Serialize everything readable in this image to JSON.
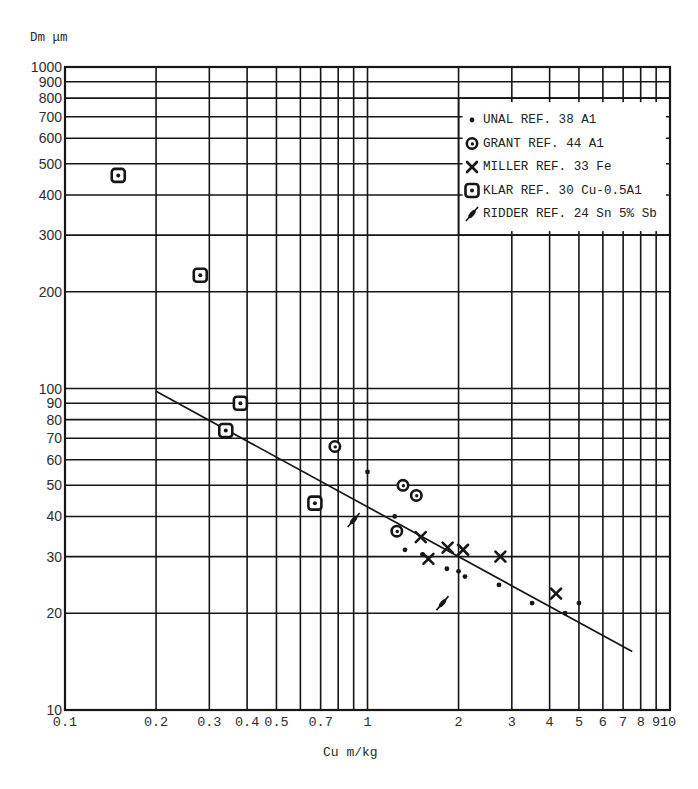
{
  "chart_data": {
    "type": "scatter",
    "title": "",
    "xlabel": "Cu m/kg",
    "ylabel": "Dm μm",
    "xscale": "log",
    "yscale": "log",
    "xlim": [
      0.1,
      10
    ],
    "ylim": [
      10,
      1000
    ],
    "grid": true,
    "x_ticks": [
      {
        "v": 0.1,
        "label": "0.1"
      },
      {
        "v": 0.2,
        "label": "0.2"
      },
      {
        "v": 0.3,
        "label": "0.3"
      },
      {
        "v": 0.4,
        "label": "0.4"
      },
      {
        "v": 0.5,
        "label": "0.5"
      },
      {
        "v": 0.7,
        "label": "0.7"
      },
      {
        "v": 1,
        "label": "1"
      },
      {
        "v": 2,
        "label": "2"
      },
      {
        "v": 3,
        "label": "3"
      },
      {
        "v": 4,
        "label": "4"
      },
      {
        "v": 5,
        "label": "5"
      },
      {
        "v": 6,
        "label": "6"
      },
      {
        "v": 7,
        "label": "7"
      },
      {
        "v": 8,
        "label": "8"
      },
      {
        "v": 9,
        "label": "9"
      },
      {
        "v": 10,
        "label": "10"
      }
    ],
    "y_ticks": [
      {
        "v": 10,
        "label": "10"
      },
      {
        "v": 20,
        "label": "20"
      },
      {
        "v": 30,
        "label": "30"
      },
      {
        "v": 40,
        "label": "40"
      },
      {
        "v": 50,
        "label": "50"
      },
      {
        "v": 60,
        "label": "60"
      },
      {
        "v": 70,
        "label": "70"
      },
      {
        "v": 80,
        "label": "80"
      },
      {
        "v": 90,
        "label": "90"
      },
      {
        "v": 100,
        "label": "100"
      },
      {
        "v": 200,
        "label": "200"
      },
      {
        "v": 300,
        "label": "300"
      },
      {
        "v": 400,
        "label": "400"
      },
      {
        "v": 500,
        "label": "500"
      },
      {
        "v": 600,
        "label": "600"
      },
      {
        "v": 700,
        "label": "700"
      },
      {
        "v": 800,
        "label": "800"
      },
      {
        "v": 900,
        "label": "900"
      },
      {
        "v": 1000,
        "label": "1000"
      }
    ],
    "x_gridlines": [
      0.2,
      0.3,
      0.4,
      0.5,
      0.6,
      0.7,
      0.8,
      0.9,
      1,
      2,
      3,
      4,
      5,
      6,
      7,
      8,
      9
    ],
    "y_gridlines": [
      20,
      30,
      40,
      50,
      60,
      70,
      80,
      90,
      100,
      200,
      300,
      400,
      500,
      600,
      700,
      800,
      900
    ],
    "legend_position": "upper right",
    "legend_box": {
      "x": [
        2,
        10
      ],
      "y": [
        300,
        800
      ]
    },
    "legend": [
      {
        "label": "UNAL REF. 38 A1",
        "marker": "dot"
      },
      {
        "label": "GRANT REF. 44 A1",
        "marker": "circle-dot"
      },
      {
        "label": "MILLER REF. 33 Fe",
        "marker": "cross"
      },
      {
        "label": "KLAR REF. 30 Cu-0.5A1",
        "marker": "square-dot"
      },
      {
        "label": "RIDDER REF. 24 Sn 5% Sb",
        "marker": "slash"
      }
    ],
    "series": [
      {
        "name": "UNAL REF. 38 A1",
        "key": "unal",
        "marker": "dot",
        "points": [
          [
            1.0,
            55
          ],
          [
            1.23,
            40
          ],
          [
            1.33,
            31.5
          ],
          [
            1.52,
            30.5
          ],
          [
            1.83,
            27.5
          ],
          [
            2.0,
            27
          ],
          [
            2.1,
            26
          ],
          [
            2.72,
            24.5
          ],
          [
            3.5,
            21.5
          ],
          [
            4.5,
            20
          ],
          [
            5.0,
            21.5
          ]
        ]
      },
      {
        "name": "GRANT REF. 44 A1",
        "key": "grant",
        "marker": "circle-dot",
        "points": [
          [
            0.78,
            66
          ],
          [
            1.31,
            50
          ],
          [
            1.45,
            46.5
          ],
          [
            1.25,
            36
          ]
        ]
      },
      {
        "name": "MILLER REF. 33 Fe",
        "key": "miller",
        "marker": "cross",
        "points": [
          [
            1.5,
            34.5
          ],
          [
            1.59,
            29.5
          ],
          [
            1.84,
            32
          ],
          [
            2.07,
            31.5
          ],
          [
            2.75,
            30
          ],
          [
            4.2,
            23
          ]
        ]
      },
      {
        "name": "KLAR REF. 30 Cu-0.5A1",
        "key": "klar",
        "marker": "square-dot",
        "points": [
          [
            0.15,
            460
          ],
          [
            0.28,
            225
          ],
          [
            0.34,
            74
          ],
          [
            0.38,
            90
          ],
          [
            0.67,
            44
          ]
        ]
      },
      {
        "name": "RIDDER REF. 24 Sn 5% Sb",
        "key": "ridder",
        "marker": "slash",
        "points": [
          [
            0.9,
            39
          ],
          [
            1.77,
            21.5
          ]
        ]
      }
    ],
    "fit_line": {
      "x": [
        0.2,
        7.5
      ],
      "y": [
        98,
        15.2
      ],
      "style": "solid"
    }
  }
}
